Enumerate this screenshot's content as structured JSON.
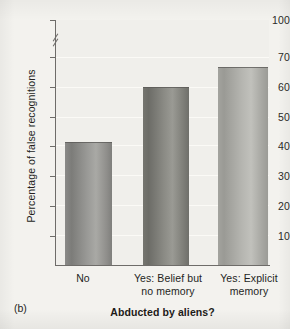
{
  "panel": {
    "label": "(b)"
  },
  "chart_data": {
    "type": "bar",
    "title": "",
    "xlabel": "Abducted by aliens?",
    "ylabel": "Percentage of false recognitions",
    "categories": [
      "No",
      "Yes: Belief but no memory",
      "Yes: Explicit memory"
    ],
    "category_lines": [
      [
        "No"
      ],
      [
        "Yes: Belief but",
        "no memory"
      ],
      [
        "Yes: Explicit",
        "memory"
      ]
    ],
    "values": [
      42,
      61,
      68
    ],
    "ylim": [
      0,
      100
    ],
    "yticks": [
      10,
      20,
      30,
      40,
      50,
      60,
      70,
      100
    ],
    "ytick_labels": [
      "10",
      "20",
      "30",
      "40",
      "50",
      "60",
      "70",
      "100"
    ],
    "axis_break": {
      "between": [
        70,
        100
      ],
      "present": true
    },
    "grid": "horizontal",
    "legend": "none",
    "bar_colors": [
      "#9a9a97",
      "#8b8b85",
      "#b4b4af"
    ],
    "plot_background": "#f0efeb",
    "axis_color": "#6e6c69"
  }
}
